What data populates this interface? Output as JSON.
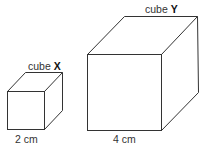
{
  "diagram": {
    "cubes": [
      {
        "id": "x",
        "name_prefix": "cube",
        "name_letter": "X",
        "side_label": "2 cm"
      },
      {
        "id": "y",
        "name_prefix": "cube",
        "name_letter": "Y",
        "side_label": "4 cm"
      }
    ]
  }
}
